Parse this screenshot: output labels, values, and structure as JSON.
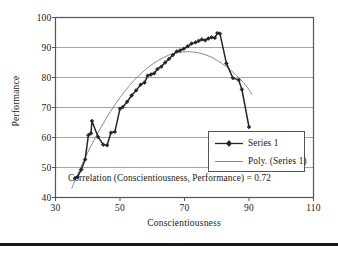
{
  "chart_data": {
    "type": "line",
    "title": "",
    "xlabel": "Conscientiousness",
    "ylabel": "Performance",
    "xlim": [
      30,
      110
    ],
    "ylim": [
      40,
      100
    ],
    "xticks": [
      30,
      50,
      70,
      90,
      110
    ],
    "yticks": [
      40,
      50,
      60,
      70,
      80,
      90,
      100
    ],
    "grid": "horizontal",
    "legend_position": "inside-lower-right",
    "annotation": "Correlation (Conscientiousness, Performance) = 0.72",
    "series": [
      {
        "name": "Series 1",
        "style": "line-with-markers",
        "color": "#262626",
        "x": [
          36.0,
          36.8,
          38.0,
          39.2,
          40.2,
          41.0,
          41.3,
          43.2,
          44.8,
          46.0,
          47.2,
          48.4,
          50.0,
          50.8,
          52.2,
          53.6,
          55.0,
          56.4,
          57.6,
          58.6,
          59.6,
          60.6,
          61.6,
          62.8,
          64.0,
          65.2,
          66.4,
          67.6,
          68.6,
          69.8,
          71.0,
          72.2,
          73.4,
          74.4,
          75.4,
          76.4,
          77.4,
          78.4,
          79.4,
          80.2,
          81.0,
          83.0,
          85.0,
          86.8,
          87.8,
          90.0
        ],
        "y": [
          46.4,
          46.8,
          49.3,
          52.7,
          60.8,
          61.4,
          65.5,
          60.2,
          57.6,
          57.4,
          61.6,
          61.9,
          69.6,
          70.1,
          71.9,
          74.0,
          75.7,
          77.6,
          78.3,
          80.6,
          81.0,
          81.4,
          82.8,
          83.6,
          85.0,
          86.2,
          87.5,
          88.7,
          89.0,
          89.6,
          90.4,
          91.3,
          91.7,
          92.2,
          92.7,
          92.4,
          93.0,
          93.4,
          93.2,
          94.8,
          94.6,
          84.7,
          79.8,
          79.2,
          76.0,
          63.5
        ]
      },
      {
        "name": "Poly. (Series 1)",
        "style": "smooth-trendline",
        "color": "#8a8a8a",
        "x": [
          35.0,
          38.0,
          41.0,
          44.0,
          47.0,
          50.0,
          53.0,
          56.0,
          59.0,
          62.0,
          65.0,
          68.0,
          71.0,
          74.0,
          77.0,
          80.0,
          83.0,
          86.0,
          89.0,
          91.0
        ],
        "y": [
          43.0,
          50.5,
          57.2,
          63.2,
          68.6,
          73.3,
          77.4,
          80.8,
          83.6,
          85.8,
          87.4,
          88.3,
          88.6,
          88.3,
          87.4,
          85.8,
          83.6,
          80.8,
          77.4,
          74.2
        ]
      }
    ]
  },
  "axes": {
    "ylabel": "Performance",
    "xlabel": "Conscientiousness",
    "ytick_labels": [
      "100",
      "90",
      "80",
      "70",
      "60",
      "50",
      "40"
    ],
    "xtick_labels": [
      "30",
      "50",
      "70",
      "90",
      "110"
    ]
  },
  "legend": {
    "items": [
      {
        "label": "Series 1",
        "marker": "diamond-line-marker",
        "color": "#262626"
      },
      {
        "label": "Poly. (Series 1)",
        "marker": "plain-line-marker",
        "color": "#8a8a8a"
      }
    ]
  },
  "annotation": {
    "text": "Correlation (Conscientiousness, Performance) = 0.72"
  },
  "colors": {
    "series": "#262626",
    "trend": "#8a8a8a",
    "grid": "#9a9a9a",
    "axis": "#555555",
    "text": "#1a1a1a",
    "rule": "#1a1a1a"
  }
}
